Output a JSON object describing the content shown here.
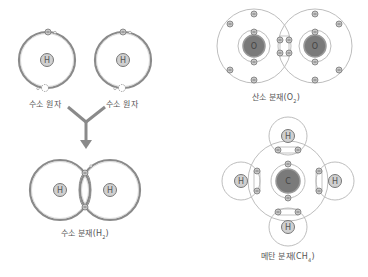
{
  "diagram": {
    "title": "",
    "colors": {
      "orbit": "#8a8a8a",
      "orbit_light": "#b5b5b5",
      "h_nucleus_fill": "#d0d0d0",
      "heavy_nucleus_fill": "#7a7a7a",
      "electron_fill": "#c8c8c8",
      "arrow": "#8a8a8a",
      "text": "#555555"
    },
    "hydrogen_atoms": [
      {
        "symbol": "H",
        "label": "수소 원자"
      },
      {
        "symbol": "H",
        "label": "수소 원자"
      }
    ],
    "hydrogen_molecule": {
      "atoms": [
        "H",
        "H"
      ],
      "label_main": "수소 분재(H",
      "label_sub": "2",
      "label_end": ")"
    },
    "oxygen_molecule": {
      "atoms": [
        "O",
        "O"
      ],
      "label_main": "산소 분재(O",
      "label_sub": "2",
      "label_end": ")"
    },
    "methane_molecule": {
      "center_atom": "C",
      "outer_atoms": [
        "H",
        "H",
        "H",
        "H"
      ],
      "label_main": "메탄 분재(CH",
      "label_sub": "4",
      "label_end": ")"
    },
    "electron_symbol": "−"
  }
}
